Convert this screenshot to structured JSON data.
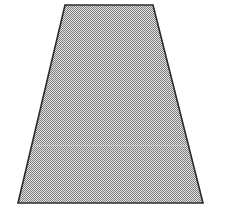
{
  "figure": {
    "name": "trapezoid-figure",
    "shape_label": "trapezoid",
    "alt_text": "Isosceles trapezoid with stippled gray fill and dark outline",
    "canvas": {
      "width": 228,
      "height": 210,
      "background_color": "#ffffff"
    },
    "shape": {
      "type": "trapezoid",
      "points": "65,5 153,5 203,203 18,203",
      "vertices": [
        {
          "name": "top-left",
          "x": 65,
          "y": 5
        },
        {
          "name": "top-right",
          "x": 153,
          "y": 5
        },
        {
          "name": "bottom-right",
          "x": 203,
          "y": 203
        },
        {
          "name": "bottom-left",
          "x": 18,
          "y": 203
        }
      ],
      "top_width": 88,
      "bottom_width": 185,
      "height": 198,
      "fill_color": "#a8a8a8",
      "fill_pattern": "checkerboard-dither",
      "pattern_light_color": "#e4e4e4",
      "pattern_dark_color": "#7c7c7c",
      "stroke_color": "#2b2b2b",
      "stroke_width": 1.6
    },
    "seam": {
      "name": "scan-seam-line",
      "y": 145,
      "x1": 31,
      "x2": 191,
      "color": "#d8d8d8",
      "opacity": 0.55
    }
  }
}
